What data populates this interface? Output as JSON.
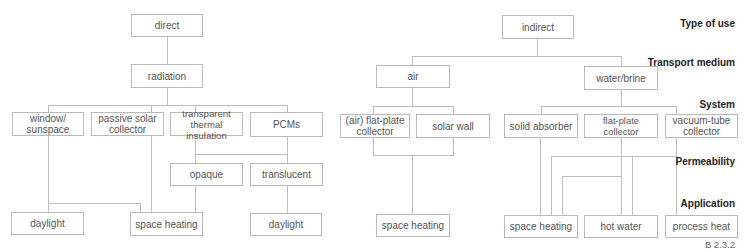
{
  "levels": {
    "type_of_use": "Type of use",
    "transport_medium": "Transport medium",
    "system": "System",
    "permeability": "Permeability",
    "application": "Application"
  },
  "figure_label": "B 2.3.2",
  "direct": {
    "type": "direct",
    "medium": "radiation",
    "systems": [
      "window/ sunspace",
      "passive solar collector",
      "transparent thermal insulation",
      "PCMs"
    ],
    "permeability": [
      "opaque",
      "translucent"
    ],
    "applications": [
      "daylight",
      "space heating",
      "daylight"
    ]
  },
  "indirect": {
    "type": "indirect",
    "media": [
      "air",
      "water/brine"
    ],
    "systems": [
      "(air) flat-plate collector",
      "solar wall",
      "solid absorber",
      "flat-plate collector",
      "vacuum-tube collector"
    ],
    "applications": [
      "space heating",
      "space heating",
      "hot water",
      "process heat"
    ]
  }
}
